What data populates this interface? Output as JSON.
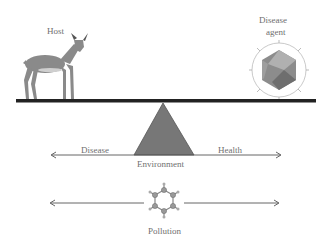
{
  "diagram": {
    "labels": {
      "host": "Host",
      "agent_line1": "Disease",
      "agent_line2": "agent",
      "disease": "Disease",
      "health": "Health",
      "environment": "Environment",
      "pollution": "Pollution"
    },
    "icons": {
      "host": "deer-icon",
      "agent": "virus-icosahedron-icon",
      "fulcrum": "triangle-fulcrum",
      "pollution": "benzene-molecule-icon"
    },
    "colors": {
      "beam": "#222222",
      "fulcrum": "#777777",
      "deer": "#8a8a8a",
      "virus": "#8c8c8c",
      "arrow": "#555555",
      "text": "#6f6f6f"
    }
  }
}
